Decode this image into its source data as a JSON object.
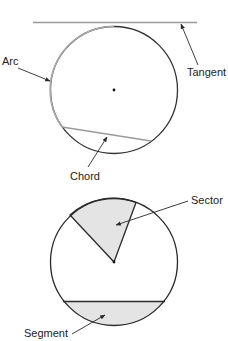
{
  "diagram": {
    "colors": {
      "stroke": "#2a2a2a",
      "light_stroke": "#9a9a9a",
      "fill": "#e4e4e4",
      "text": "#222222"
    },
    "top_circle": {
      "center": [
        114,
        90
      ],
      "radius": 63,
      "labels": {
        "arc": "Arc",
        "tangent": "Tangent",
        "chord": "Chord"
      }
    },
    "bottom_circle": {
      "center": [
        114,
        262
      ],
      "radius": 63,
      "labels": {
        "sector": "Sector",
        "segment": "Segment"
      }
    }
  }
}
